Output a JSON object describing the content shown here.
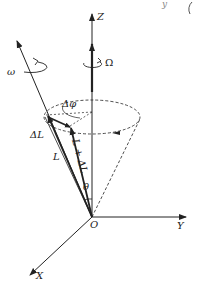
{
  "diagram": {
    "type": "precession-cone",
    "labels": {
      "z_axis": "Z",
      "y_axis": "Y",
      "x_axis": "X",
      "origin": "O",
      "omega_spin": "ω",
      "omega_precession": "Ω",
      "angular_momentum": "L",
      "angular_momentum_new": "L + ΔL",
      "delta_L": "ΔL",
      "delta_phi": "Δφ",
      "theta": "θ",
      "cropped_fragment": "y"
    },
    "colors": {
      "line": "#222222",
      "background": "#ffffff"
    }
  }
}
